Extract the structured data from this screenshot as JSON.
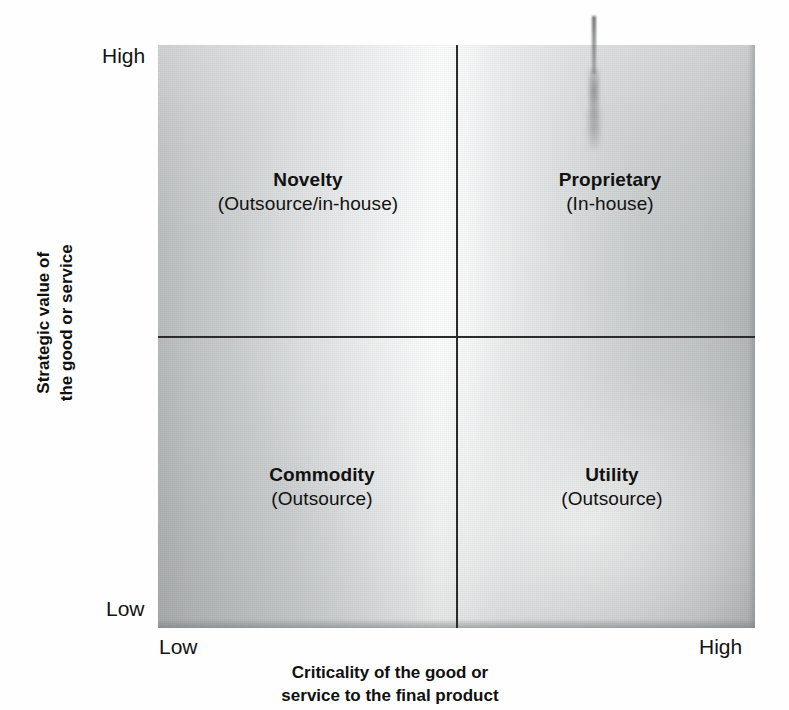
{
  "chart_data": {
    "type": "table",
    "xlabel": "Criticality of the good or service to the final product",
    "ylabel": "Strategic value of the good or service",
    "x_ticks": [
      "Low",
      "High"
    ],
    "y_ticks": [
      "Low",
      "High"
    ],
    "grid": false,
    "legend": "none",
    "quadrants": [
      {
        "key": "novelty",
        "title": "Novelty",
        "subtitle": "(Outsource/in-house)",
        "x": "Low",
        "y": "High",
        "position": "top-left"
      },
      {
        "key": "proprietary",
        "title": "Proprietary",
        "subtitle": "(In-house)",
        "x": "High",
        "y": "High",
        "position": "top-right"
      },
      {
        "key": "commodity",
        "title": "Commodity",
        "subtitle": "(Outsource)",
        "x": "Low",
        "y": "Low",
        "position": "bottom-left"
      },
      {
        "key": "utility",
        "title": "Utility",
        "subtitle": "(Outsource)",
        "x": "High",
        "y": "Low",
        "position": "bottom-right"
      }
    ]
  },
  "axes": {
    "y": {
      "title_line1": "Strategic value of",
      "title_line2": "the good or service",
      "tick_high": "High",
      "tick_low": "Low"
    },
    "x": {
      "title_line1": "Criticality of the good or",
      "title_line2": "service to the final product",
      "tick_low": "Low",
      "tick_high": "High"
    }
  },
  "colors": {
    "line": "#2b2b2b",
    "text": "#111111",
    "panel_light": "#fbfcfc",
    "panel_dark": "#b2b5b6",
    "background": "#ffffff"
  }
}
